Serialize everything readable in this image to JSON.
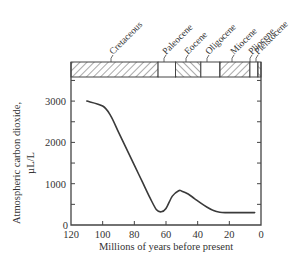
{
  "chart_data": {
    "type": "line",
    "title": "",
    "xlabel": "Millions of years before present",
    "ylabel": "Atmospheric carbon dioxide,",
    "ylabel_units": "µL/L",
    "xlim": [
      120,
      0
    ],
    "ylim": [
      0,
      3500
    ],
    "x_ticks": [
      120,
      100,
      80,
      60,
      40,
      20,
      0
    ],
    "y_ticks": [
      0,
      1000,
      2000,
      3000
    ],
    "y_minor_ticks": [
      500,
      1500,
      2500,
      3500
    ],
    "grid": false,
    "legend": null,
    "series": [
      {
        "name": "Atmospheric CO2",
        "x": [
          110,
          100,
          95,
          90,
          85,
          80,
          75,
          70,
          66,
          63,
          60,
          56,
          52,
          50,
          46,
          42,
          38,
          34,
          30,
          26,
          22,
          18,
          12,
          6,
          4
        ],
        "y": [
          3000,
          2880,
          2650,
          2250,
          1850,
          1450,
          1050,
          650,
          370,
          320,
          400,
          700,
          830,
          820,
          750,
          640,
          530,
          430,
          350,
          310,
          300,
          300,
          300,
          300,
          300
        ]
      }
    ],
    "epoch_band": [
      {
        "name": "Cretaceous",
        "start": 120,
        "end": 65,
        "pattern": "hatch-right"
      },
      {
        "name": "Paleocene",
        "start": 65,
        "end": 54,
        "pattern": "blank"
      },
      {
        "name": "Eocene",
        "start": 54,
        "end": 38,
        "pattern": "hatch-left"
      },
      {
        "name": "Oligocene",
        "start": 38,
        "end": 26,
        "pattern": "blank"
      },
      {
        "name": "Miocene",
        "start": 26,
        "end": 7,
        "pattern": "hatch-right"
      },
      {
        "name": "Pliocene",
        "start": 7,
        "end": 2,
        "pattern": "blank"
      },
      {
        "name": "Pleistocene",
        "start": 2,
        "end": 0,
        "pattern": "hatch-left"
      }
    ]
  },
  "labels": {
    "xlabel": "Millions of years before present",
    "ylabel_line1": "Atmospheric carbon dioxide,",
    "ylabel_line2": "µL/L"
  },
  "colors": {
    "line": "#3a3a3a",
    "axis": "#444444",
    "text": "#333333"
  }
}
